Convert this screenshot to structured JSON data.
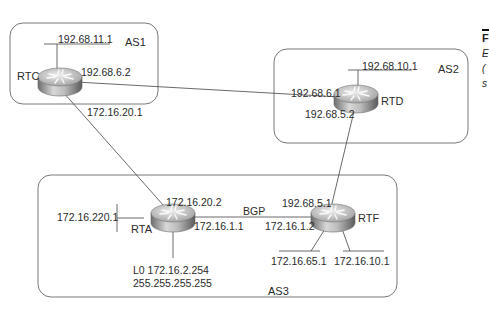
{
  "diagram": {
    "autonomous_systems": [
      {
        "id": "as1",
        "label": "AS1"
      },
      {
        "id": "as2",
        "label": "AS2"
      },
      {
        "id": "as3",
        "label": "AS3"
      }
    ],
    "routers": {
      "rtc": {
        "label": "RTC",
        "as": "AS1"
      },
      "rtd": {
        "label": "RTD",
        "as": "AS2"
      },
      "rta": {
        "label": "RTA",
        "as": "AS3"
      },
      "rtf": {
        "label": "RTF",
        "as": "AS3"
      }
    },
    "addresses": {
      "rtc_lan": "192.68.11.1",
      "rtc_to_rtd": "192.68.6.2",
      "rtc_to_rta": "172.16.20.1",
      "rtd_lan": "192.68.10.1",
      "rtd_to_rtc": "192.68.6.1",
      "rtd_to_rtf": "192.68.5.2",
      "rta_to_rtc": "172.16.20.2",
      "rta_lan": "172.16.220.1",
      "rta_to_rtf": "172.16.1.1",
      "rta_loopback": "L0 172.16.2.254",
      "rta_loopback_mask": "255.255.255.255",
      "rtf_to_rtd": "192.68.5.1",
      "rtf_to_rta": "172.16.1.2",
      "rtf_lan1": "172.16.65.1",
      "rtf_lan2": "172.16.10.1"
    },
    "link_labels": {
      "rta_rtf": "BGP"
    },
    "side_caption_fragments": [
      "F",
      "E",
      "(",
      "s"
    ]
  }
}
